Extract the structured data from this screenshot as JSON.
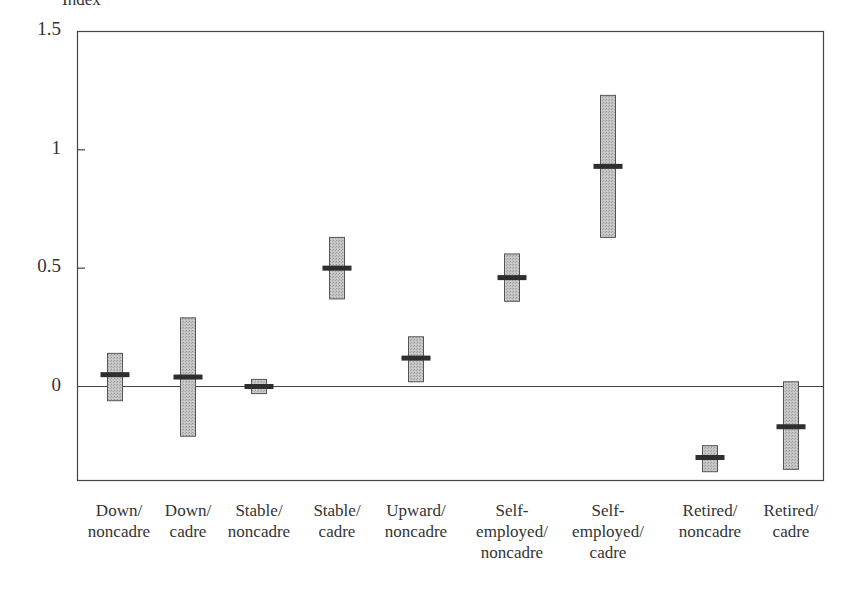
{
  "chart_data": {
    "type": "box",
    "title": "",
    "ylabel": "Index",
    "xlabel": "",
    "ylim": [
      -0.4,
      1.5
    ],
    "yticks": [
      0,
      0.5,
      1,
      1.5
    ],
    "ytick_labels": [
      "0",
      "0.5",
      "1",
      "1.5"
    ],
    "grid": false,
    "legend": null,
    "reference_line": 0,
    "categories": [
      "Down/\nnoncadre",
      "Down/\ncadre",
      "Stable/\nnoncadre",
      "Stable/\ncadre",
      "Upward/\nnoncadre",
      "Self-\nemployed/\nnoncadre",
      "Self-\nemployed/\ncadre",
      "Retired/\nnoncadre",
      "Retired/\ncadre"
    ],
    "series": [
      {
        "name": "estimate",
        "values": [
          0.05,
          0.04,
          0.0,
          0.5,
          0.12,
          0.46,
          0.93,
          -0.3,
          -0.17
        ]
      },
      {
        "name": "interval_upper",
        "values": [
          0.14,
          0.29,
          0.03,
          0.63,
          0.21,
          0.56,
          1.23,
          -0.25,
          0.02
        ]
      },
      {
        "name": "interval_lower",
        "values": [
          -0.06,
          -0.21,
          -0.03,
          0.37,
          0.02,
          0.36,
          0.63,
          -0.36,
          -0.35
        ]
      }
    ]
  },
  "style": {
    "box_fill": "#bdbdbd",
    "box_stroke": "#555555",
    "mean_color": "#2e2e2e",
    "axis_color": "#444444"
  }
}
